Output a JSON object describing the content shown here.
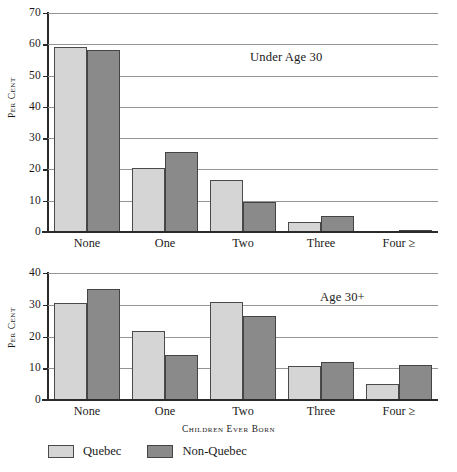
{
  "chart_data": [
    {
      "type": "bar",
      "title": "Under Age 30",
      "xlabel": "",
      "ylabel": "Per Cent",
      "categories": [
        "None",
        "One",
        "Two",
        "Three",
        "Four ≥"
      ],
      "ylim": [
        0,
        70
      ],
      "yticks": [
        0,
        10,
        20,
        30,
        40,
        50,
        60,
        70
      ],
      "grid": true,
      "legend_position": "bottom",
      "series": [
        {
          "name": "Quebec",
          "color": "#d5d5d5",
          "values": [
            59.0,
            20.4,
            16.5,
            3.2,
            0.0
          ]
        },
        {
          "name": "Non-Quebec",
          "color": "#8a8a8a",
          "values": [
            58.1,
            25.7,
            9.6,
            5.0,
            0.6
          ]
        }
      ]
    },
    {
      "type": "bar",
      "title": "Age 30+",
      "xlabel": "Children Ever Born",
      "ylabel": "Per Cent",
      "categories": [
        "None",
        "One",
        "Two",
        "Three",
        "Four ≥"
      ],
      "ylim": [
        0,
        40
      ],
      "yticks": [
        0,
        10,
        20,
        30,
        40
      ],
      "grid": true,
      "legend_position": "bottom",
      "series": [
        {
          "name": "Quebec",
          "color": "#d5d5d5",
          "values": [
            30.4,
            21.7,
            31.0,
            10.6,
            5.2
          ]
        },
        {
          "name": "Non-Quebec",
          "color": "#8a8a8a",
          "values": [
            35.0,
            14.3,
            26.5,
            12.0,
            11.1
          ]
        }
      ]
    }
  ],
  "legend": {
    "items": [
      {
        "label": "Quebec",
        "swatch": "light"
      },
      {
        "label": "Non-Quebec",
        "swatch": "dark"
      }
    ]
  },
  "xaxis_title": "Children Ever Born"
}
